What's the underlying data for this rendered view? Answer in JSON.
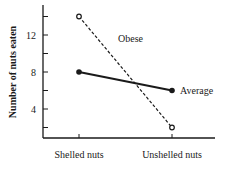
{
  "chart_data": {
    "type": "line",
    "title": "",
    "xlabel": "",
    "ylabel": "Number of nuts eaten",
    "categories": [
      "Shelled nuts",
      "Unshelled nuts"
    ],
    "series": [
      {
        "name": "Obese",
        "values": [
          14,
          2
        ],
        "style": "dashed",
        "marker": "open-circle"
      },
      {
        "name": "Average",
        "values": [
          8,
          6
        ],
        "style": "solid",
        "marker": "filled-circle"
      }
    ],
    "yticks": [
      2,
      4,
      6,
      8,
      10,
      12,
      14
    ],
    "ytick_labels": [
      "4",
      "8",
      "12"
    ],
    "ylim": [
      0,
      15
    ],
    "grid": false,
    "legend": "inline labels"
  },
  "colors": {
    "ink": "#1a1a1a",
    "background": "#ffffff"
  }
}
